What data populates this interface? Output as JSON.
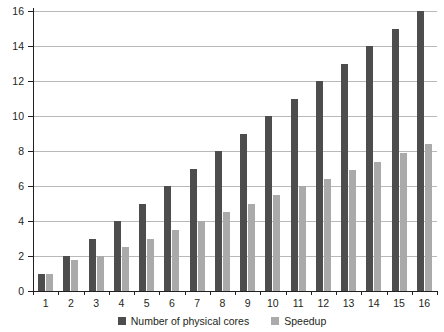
{
  "chart_data": {
    "type": "bar",
    "title": "",
    "xlabel": "",
    "ylabel": "",
    "categories": [
      "1",
      "2",
      "3",
      "4",
      "5",
      "6",
      "7",
      "8",
      "9",
      "10",
      "11",
      "12",
      "13",
      "14",
      "15",
      "16"
    ],
    "series": [
      {
        "name": "Number of physical cores",
        "color": "#4d4d4d",
        "values": [
          1,
          2,
          3,
          4,
          5,
          6,
          7,
          8,
          9,
          10,
          11,
          12,
          13,
          14,
          15,
          16
        ]
      },
      {
        "name": "Speedup",
        "color": "#aaaaaa",
        "values": [
          1,
          1.8,
          2,
          2.5,
          3,
          3.5,
          4,
          4.5,
          5,
          5.5,
          6,
          6.4,
          6.9,
          7.4,
          7.9,
          8.4
        ]
      }
    ],
    "ylim": [
      0,
      16
    ],
    "yticks": [
      0,
      2,
      4,
      6,
      8,
      10,
      12,
      14,
      16
    ],
    "ytick_labels": [
      "0",
      "2",
      "4",
      "6",
      "8",
      "10",
      "12",
      "14",
      "16"
    ],
    "grid": true,
    "legend_position": "bottom-center"
  },
  "legend": {
    "items": [
      {
        "label": "Number of physical cores",
        "color": "#4d4d4d"
      },
      {
        "label": "Speedup",
        "color": "#aaaaaa"
      }
    ]
  },
  "colors": {
    "axis": "#231f20",
    "gridline": "#b9b9b9",
    "background": "#ffffff",
    "series_dark": "#4d4d4d",
    "series_light": "#aaaaaa"
  }
}
